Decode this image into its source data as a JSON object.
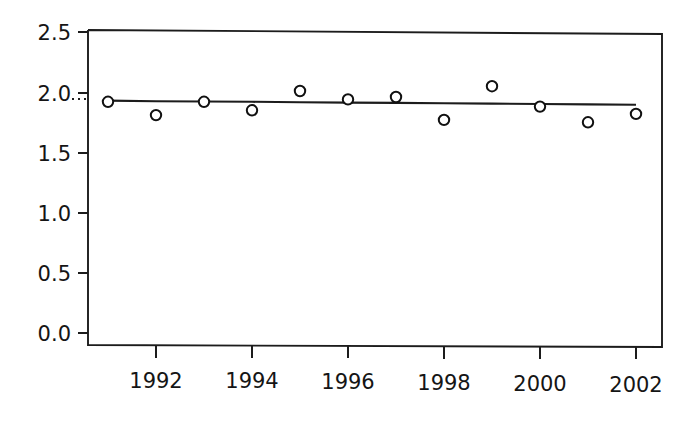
{
  "chart_data": {
    "type": "scatter",
    "title": "",
    "subtitle": "",
    "xlabel": "",
    "ylabel": "",
    "x": [
      1991,
      1992,
      1993,
      1994,
      1995,
      1996,
      1997,
      1998,
      1999,
      2000,
      2001,
      2002
    ],
    "values": [
      1.92,
      1.81,
      1.92,
      1.85,
      2.01,
      1.94,
      1.96,
      1.77,
      2.05,
      1.88,
      1.75,
      1.82
    ],
    "series": [
      {
        "name": "observed",
        "marker": "open-circle",
        "values": [
          1.92,
          1.81,
          1.92,
          1.85,
          2.01,
          1.94,
          1.96,
          1.77,
          2.05,
          1.88,
          1.75,
          1.82
        ]
      },
      {
        "name": "trend",
        "marker": "none",
        "values": [
          1.93,
          1.925,
          1.923,
          1.92,
          1.917,
          1.914,
          1.911,
          1.908,
          1.905,
          1.902,
          1.899,
          1.896
        ]
      }
    ],
    "xlim": [
      1991,
      2002
    ],
    "ylim": [
      0.0,
      2.6
    ],
    "ytick_labels": [
      "0.0",
      "0.5",
      "1.0",
      "1.5",
      "2.0",
      "2.5"
    ],
    "ytick_values": [
      0.0,
      0.5,
      1.0,
      1.5,
      2.0,
      2.5
    ],
    "xtick_labels": [
      "1992",
      "1994",
      "1996",
      "1998",
      "2000",
      "2002"
    ],
    "xtick_values": [
      1992,
      1994,
      1996,
      1998,
      2000,
      2002
    ],
    "grid": false,
    "legend": "none",
    "annotations": [
      {
        "name": "reference-dots",
        "text": "",
        "near_value": 1.93
      }
    ],
    "axis_color": "#1c1c1c",
    "marker_color": "#111111",
    "background": "#ffffff"
  }
}
